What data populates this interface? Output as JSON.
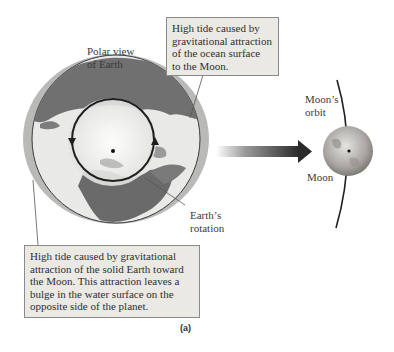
{
  "figure": {
    "caption": "(a)",
    "labels": {
      "polar_view": [
        "Polar view",
        "of Earth"
      ],
      "earth_rotation": [
        "Earth’s",
        "rotation"
      ],
      "moon_orbit": [
        "Moon’s",
        "orbit"
      ],
      "moon": "Moon"
    },
    "callouts": {
      "top": [
        "High tide caused by",
        "gravitational attraction",
        "of the ocean surface",
        "to the Moon."
      ],
      "bottom": [
        "High tide caused by gravitational",
        "attraction of the solid Earth toward",
        "the Moon. This attraction leaves a",
        "bulge in the water surface on the",
        "opposite side of the planet."
      ]
    },
    "colors": {
      "ocean": "#e9e9e7",
      "land": "#6f6f6f",
      "tide_bulge": "#b9b9b7",
      "arrow_dark": "#2a2a2a",
      "callout_bg": "#ebe9e4"
    },
    "icons": [
      "earth-globe",
      "moon-sphere",
      "rotation-arrow-icon",
      "gravity-arrow-icon"
    ]
  }
}
